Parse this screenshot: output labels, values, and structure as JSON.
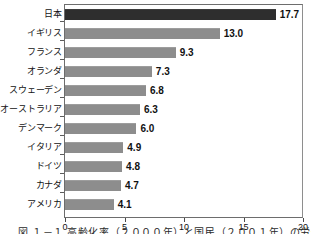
{
  "chart_data": {
    "type": "bar",
    "orientation": "horizontal",
    "title": "",
    "xlabel": "",
    "ylabel": "",
    "xlim": [
      0,
      20
    ],
    "grid": false,
    "legend": "none",
    "categories": [
      "日本",
      "イギリス",
      "フランス",
      "オランダ",
      "スウェーデン",
      "オーストラリア",
      "デンマーク",
      "イタリア",
      "ドイツ",
      "カナダ",
      "アメリカ"
    ],
    "values": [
      17.7,
      13.0,
      9.3,
      7.3,
      6.8,
      6.3,
      6.0,
      4.9,
      4.8,
      4.7,
      4.1
    ],
    "value_labels": [
      "17.7",
      "13.0",
      "9.3",
      "7.3",
      "6.8",
      "6.3",
      "6.0",
      "4.9",
      "4.8",
      "4.7",
      "4.1"
    ],
    "xticks": [
      0,
      5,
      10,
      15,
      20
    ],
    "xtick_labels": [
      "0",
      "5",
      "10",
      "15",
      "20"
    ],
    "bar_color": "#8d8d8d",
    "highlight_color": "#2e2e2e",
    "highlight_index": 0
  },
  "caption": {
    "text": "図   １－１  高齢化率（２０００年）と国民（２００１年）の労働力"
  }
}
